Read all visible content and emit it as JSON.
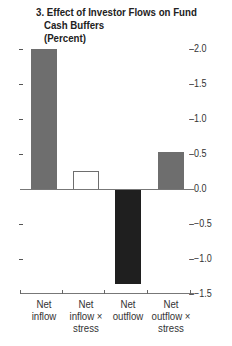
{
  "chart_data": {
    "type": "bar",
    "title": "3. Effect of Investor Flows on Fund Cash Buffers",
    "subtitle": "(Percent)",
    "categories": [
      "Net inflow",
      "Net inflow × stress",
      "Net outflow",
      "Net outflow × stress"
    ],
    "values": [
      2.0,
      0.26,
      -1.34,
      0.53
    ],
    "bar_styles": [
      {
        "fill": "#6e6e6e",
        "border": "#6e6e6e"
      },
      {
        "fill": "#ffffff",
        "border": "#6e6e6e"
      },
      {
        "fill": "#1f1f1f",
        "border": "#1f1f1f"
      },
      {
        "fill": "#6e6e6e",
        "border": "#6e6e6e"
      }
    ],
    "xlabel": "",
    "ylabel": "",
    "ylim": [
      -1.5,
      2.0
    ],
    "y_ticks": [
      "2.0",
      "1.5",
      "1.0",
      "0.5",
      "0.0",
      "−0.5",
      "−1.0",
      "−1.5"
    ],
    "y_axis_position": "right",
    "grid": false,
    "legend": null
  },
  "title_lines": [
    "3. Effect of Investor Flows on Fund",
    "Cash Buffers",
    "(Percent)"
  ],
  "x_labels": [
    [
      "Net",
      "inflow"
    ],
    [
      "Net",
      "inflow ×",
      "stress"
    ],
    [
      "Net",
      "outflow"
    ],
    [
      "Net",
      "outflow ×",
      "stress"
    ]
  ]
}
